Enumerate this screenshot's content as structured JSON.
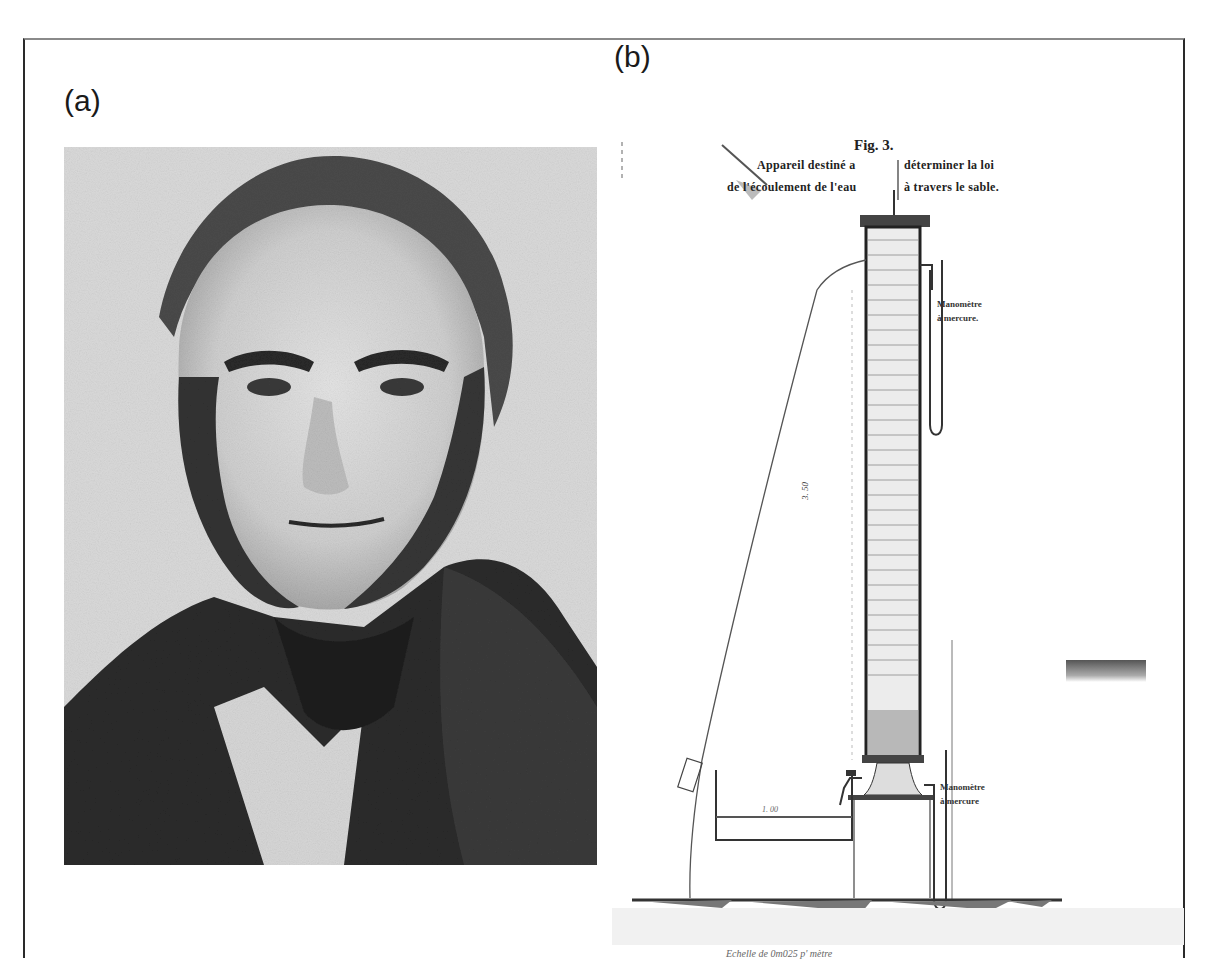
{
  "figure": {
    "panels": [
      {
        "label": "(a)",
        "content": "portrait-photograph",
        "description": "Black-and-white portrait of a man with receding hair and side whiskers, dark coat and white collar"
      },
      {
        "label": "(b)",
        "content": "engraved-apparatus-diagram"
      }
    ]
  },
  "panel_a": {
    "label": "(a)"
  },
  "panel_b": {
    "label": "(b)",
    "fig_number": "Fig. 3.",
    "caption_line1_left": "Appareil destiné a",
    "caption_line1_right": "déterminer la loi",
    "caption_line2_left": "de l'écoulement de l'eau",
    "caption_line2_right": "à travers le sable.",
    "manometer_top_line1": "Manomètre",
    "manometer_top_line2": "à mercure.",
    "manometer_bottom_line1": "Manomètre",
    "manometer_bottom_line2": "à mercure",
    "column_height_dim": "3. 50",
    "column_mark": "0. 23",
    "tank_dim": "1. 00",
    "scale_caption": "Echelle de 0m025 p' mètre"
  },
  "colors": {
    "frame_border": "#2a2a2a",
    "frame_top": "#8a8a8a",
    "photo_bg": "#d9d9d9",
    "ink": "#222222"
  }
}
